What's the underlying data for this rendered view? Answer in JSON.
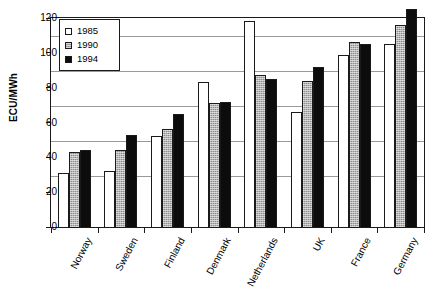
{
  "chart_data": {
    "type": "bar",
    "title": "",
    "xlabel": "",
    "ylabel": "ECU/MWh",
    "ylim": [
      0,
      120
    ],
    "yticks": [
      0,
      20,
      40,
      60,
      80,
      100,
      120
    ],
    "grid": true,
    "legend_position": "top-left",
    "categories": [
      "Norway",
      "Sweden",
      "Finland",
      "Denmark",
      "Netherlands",
      "UK",
      "France",
      "Germany"
    ],
    "series": [
      {
        "name": "1985",
        "color": "#ffffff",
        "values": [
          31,
          32,
          52,
          83,
          118,
          66,
          99,
          105
        ]
      },
      {
        "name": "1990",
        "color": "#8d8d8d",
        "values": [
          43,
          44,
          56,
          71,
          87,
          84,
          106,
          116
        ]
      },
      {
        "name": "1994",
        "color": "#0c0c0c",
        "values": [
          44,
          53,
          65,
          72,
          85,
          92,
          105,
          125
        ]
      }
    ]
  },
  "axis": {
    "y_title": "ECU/MWh",
    "y_tick_labels": [
      "120",
      "100",
      "80",
      "60",
      "40",
      "20",
      "0"
    ]
  },
  "legend": {
    "entries": [
      {
        "label": "1985"
      },
      {
        "label": "1990"
      },
      {
        "label": "1994"
      }
    ]
  }
}
